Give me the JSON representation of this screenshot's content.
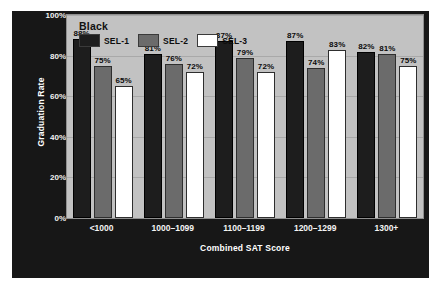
{
  "chart_data": {
    "type": "bar",
    "title": "Black",
    "subtitle": "",
    "xlabel": "Combined SAT Score",
    "ylabel": "Graduation Rate",
    "categories": [
      "<1000",
      "1000–1099",
      "1100–1199",
      "1200–1299",
      "1300+"
    ],
    "series": [
      {
        "name": "SEL-1",
        "color": "#1d1d1d",
        "values": [
          88,
          81,
          87,
          87,
          82
        ],
        "labels": [
          "88%",
          "81%",
          "87%",
          "87%",
          "82%"
        ]
      },
      {
        "name": "SEL-2",
        "color": "#6b6b6b",
        "values": [
          75,
          76,
          79,
          74,
          81
        ],
        "labels": [
          "75%",
          "76%",
          "79%",
          "74%",
          "81%"
        ]
      },
      {
        "name": "SEL-3",
        "color": "#ffffff",
        "values": [
          65,
          72,
          72,
          83,
          75
        ],
        "labels": [
          "65%",
          "72%",
          "72%",
          "83%",
          "75%"
        ]
      }
    ],
    "ylim": [
      0,
      100
    ],
    "yticks": [
      0,
      20,
      40,
      60,
      80,
      100
    ],
    "ytick_labels": [
      "0%",
      "20%",
      "40%",
      "60%",
      "80%",
      "100%"
    ],
    "grid": true,
    "legend_position": "top-left",
    "value_labels": true,
    "colors": {
      "panel_background": "#171717",
      "plot_background": "#c2c2c2",
      "gridline": "#a9a9a9",
      "axis_text": "#f4f4f4",
      "label_text": "#0b0b0b"
    }
  }
}
